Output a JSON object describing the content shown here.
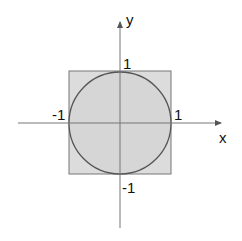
{
  "diagram": {
    "axes": {
      "x_label": "x",
      "y_label": "y"
    },
    "ticks": {
      "x_pos": "1",
      "x_neg": "-1",
      "y_pos": "1",
      "y_neg": "-1"
    },
    "colors": {
      "fill": "#dcdcdc",
      "stroke": "#666666",
      "axis": "#777777",
      "text": "#111111"
    },
    "shapes": {
      "square": {
        "x_range": [
          -1,
          1
        ],
        "y_range": [
          -1,
          1
        ]
      },
      "circle": {
        "center": [
          0,
          0
        ],
        "radius": 1
      }
    }
  }
}
